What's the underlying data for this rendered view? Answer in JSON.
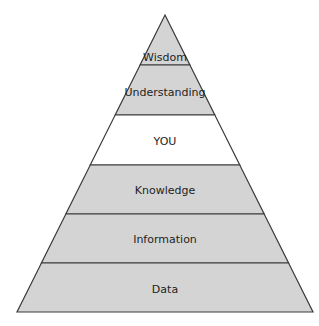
{
  "diagram": {
    "type": "pyramid",
    "apex": {
      "x": 165,
      "y": 15
    },
    "base": {
      "y": 312,
      "left_x": 17,
      "right_x": 313
    },
    "colors": {
      "band_fill": "#d4d4d4",
      "highlight_fill": "#ffffff",
      "stroke": "#3a3a3a",
      "text": "#1e1e1e"
    },
    "levels": [
      {
        "label": "Wisdom",
        "top_y": 15,
        "bottom_y": 65,
        "fill": "#d4d4d4",
        "label_y": 58
      },
      {
        "label": "Understanding",
        "top_y": 65,
        "bottom_y": 115,
        "fill": "#d4d4d4",
        "label_y": 93
      },
      {
        "label": "YOU",
        "top_y": 115,
        "bottom_y": 165,
        "fill": "#ffffff",
        "label_y": 142
      },
      {
        "label": "Knowledge",
        "top_y": 165,
        "bottom_y": 214,
        "fill": "#d4d4d4",
        "label_y": 191
      },
      {
        "label": "Information",
        "top_y": 214,
        "bottom_y": 263,
        "fill": "#d4d4d4",
        "label_y": 240
      },
      {
        "label": "Data",
        "top_y": 263,
        "bottom_y": 312,
        "fill": "#d4d4d4",
        "label_y": 290
      }
    ]
  }
}
